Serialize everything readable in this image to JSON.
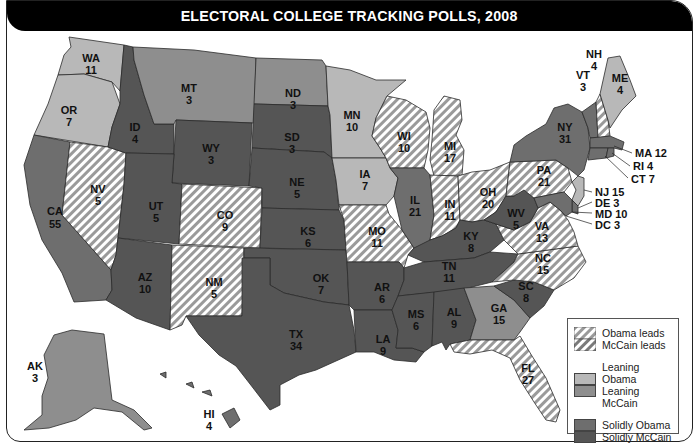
{
  "title": "ELECTORAL COLLEGE TRACKING POLLS, 2008",
  "colors": {
    "obama_leads_stripe": "#9a9a9a",
    "mccain_leads_stripe": "#8a8a8a",
    "leaning_obama": "#b8b8b8",
    "leaning_mccain": "#8e8e8e",
    "solidly_obama": "#6e6e6e",
    "solidly_mccain": "#555555",
    "background": "#ffffff",
    "title_bar": "#000000"
  },
  "legend": {
    "groups": [
      {
        "items": [
          {
            "label": "Obama leads",
            "category": "obama_leads"
          },
          {
            "label": "McCain leads",
            "category": "mccain_leads"
          }
        ]
      },
      {
        "items": [
          {
            "label": "Leaning Obama",
            "category": "leaning_obama"
          },
          {
            "label": "Leaning McCain",
            "category": "leaning_mccain"
          }
        ]
      },
      {
        "items": [
          {
            "label": "Solidly Obama",
            "category": "solidly_obama"
          },
          {
            "label": "Solidly McCain",
            "category": "solidly_mccain"
          }
        ]
      }
    ]
  },
  "states": [
    {
      "abbr": "WA",
      "votes": "11",
      "category": "leaning_obama"
    },
    {
      "abbr": "OR",
      "votes": "7",
      "category": "leaning_obama"
    },
    {
      "abbr": "CA",
      "votes": "55",
      "category": "solidly_obama"
    },
    {
      "abbr": "NV",
      "votes": "5",
      "category": "obama_leads"
    },
    {
      "abbr": "ID",
      "votes": "4",
      "category": "solidly_mccain"
    },
    {
      "abbr": "MT",
      "votes": "3",
      "category": "leaning_mccain"
    },
    {
      "abbr": "WY",
      "votes": "3",
      "category": "solidly_mccain"
    },
    {
      "abbr": "UT",
      "votes": "5",
      "category": "solidly_mccain"
    },
    {
      "abbr": "CO",
      "votes": "9",
      "category": "obama_leads"
    },
    {
      "abbr": "AZ",
      "votes": "10",
      "category": "solidly_mccain"
    },
    {
      "abbr": "NM",
      "votes": "5",
      "category": "obama_leads"
    },
    {
      "abbr": "ND",
      "votes": "3",
      "category": "leaning_mccain"
    },
    {
      "abbr": "SD",
      "votes": "3",
      "category": "solidly_mccain"
    },
    {
      "abbr": "NE",
      "votes": "5",
      "category": "solidly_mccain"
    },
    {
      "abbr": "KS",
      "votes": "6",
      "category": "solidly_mccain"
    },
    {
      "abbr": "OK",
      "votes": "7",
      "category": "solidly_mccain"
    },
    {
      "abbr": "TX",
      "votes": "34",
      "category": "solidly_mccain"
    },
    {
      "abbr": "MN",
      "votes": "10",
      "category": "leaning_obama"
    },
    {
      "abbr": "IA",
      "votes": "7",
      "category": "leaning_obama"
    },
    {
      "abbr": "MO",
      "votes": "11",
      "category": "obama_leads"
    },
    {
      "abbr": "AR",
      "votes": "6",
      "category": "solidly_mccain"
    },
    {
      "abbr": "LA",
      "votes": "9",
      "category": "solidly_mccain"
    },
    {
      "abbr": "WI",
      "votes": "10",
      "category": "obama_leads"
    },
    {
      "abbr": "IL",
      "votes": "21",
      "category": "solidly_obama"
    },
    {
      "abbr": "MI",
      "votes": "17",
      "category": "obama_leads"
    },
    {
      "abbr": "IN",
      "votes": "11",
      "category": "obama_leads"
    },
    {
      "abbr": "OH",
      "votes": "20",
      "category": "obama_leads"
    },
    {
      "abbr": "KY",
      "votes": "8",
      "category": "solidly_mccain"
    },
    {
      "abbr": "TN",
      "votes": "11",
      "category": "solidly_mccain"
    },
    {
      "abbr": "MS",
      "votes": "6",
      "category": "solidly_mccain"
    },
    {
      "abbr": "AL",
      "votes": "9",
      "category": "solidly_mccain"
    },
    {
      "abbr": "GA",
      "votes": "15",
      "category": "leaning_mccain"
    },
    {
      "abbr": "FL",
      "votes": "27",
      "category": "obama_leads"
    },
    {
      "abbr": "SC",
      "votes": "8",
      "category": "solidly_mccain"
    },
    {
      "abbr": "NC",
      "votes": "15",
      "category": "obama_leads"
    },
    {
      "abbr": "VA",
      "votes": "13",
      "category": "obama_leads"
    },
    {
      "abbr": "WV",
      "votes": "5",
      "category": "solidly_mccain"
    },
    {
      "abbr": "PA",
      "votes": "21",
      "category": "obama_leads"
    },
    {
      "abbr": "NY",
      "votes": "31",
      "category": "solidly_obama"
    },
    {
      "abbr": "VT",
      "votes": "3",
      "category": "solidly_obama"
    },
    {
      "abbr": "NH",
      "votes": "4",
      "category": "obama_leads"
    },
    {
      "abbr": "ME",
      "votes": "4",
      "category": "leaning_obama"
    },
    {
      "abbr": "MA",
      "votes": "12",
      "category": "solidly_obama"
    },
    {
      "abbr": "RI",
      "votes": "4",
      "category": "solidly_obama"
    },
    {
      "abbr": "CT",
      "votes": "7",
      "category": "solidly_obama"
    },
    {
      "abbr": "NJ",
      "votes": "15",
      "category": "leaning_obama"
    },
    {
      "abbr": "DE",
      "votes": "3",
      "category": "solidly_obama"
    },
    {
      "abbr": "MD",
      "votes": "10",
      "category": "solidly_obama"
    },
    {
      "abbr": "DC",
      "votes": "3",
      "category": "solidly_obama"
    },
    {
      "abbr": "AK",
      "votes": "3",
      "category": "leaning_mccain"
    },
    {
      "abbr": "HI",
      "votes": "4",
      "category": "solidly_obama"
    }
  ],
  "callouts": {
    "MA": "MA 12",
    "RI": "RI 4",
    "CT": "CT 7",
    "NJ": "NJ 15",
    "DE": "DE 3",
    "MD": "MD 10",
    "DC": "DC 3"
  }
}
